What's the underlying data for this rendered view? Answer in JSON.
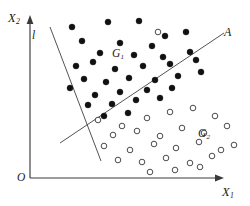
{
  "figure": {
    "background_color": "#ffffff",
    "axis_color": "#3a3a3a",
    "line_color": "#4a4a4a",
    "filled_point_color": "#111111",
    "open_point_color": "#ffffff"
  },
  "labels": {
    "y_axis": "X",
    "y_axis_sub": "2",
    "x_axis": "X",
    "x_axis_sub": "1",
    "origin": "O",
    "line_l": "l",
    "line_a": "A",
    "group1": "G",
    "group1_sub": "1",
    "group2": "G",
    "group2_sub": "2"
  },
  "chart_data": {
    "type": "scatter",
    "title": "",
    "xlabel": "X1",
    "ylabel": "X2",
    "grid": false,
    "legend": "none",
    "xlim": [
      0,
      250
    ],
    "ylim": [
      0,
      206
    ],
    "note": "Pixel coordinates in image space; y grows downward.",
    "series": [
      {
        "name": "G1",
        "marker": "filled-circle",
        "radius": 3.0,
        "color": "#111111",
        "points": [
          [
            72,
            27
          ],
          [
            108,
            22
          ],
          [
            139,
            21
          ],
          [
            165,
            36
          ],
          [
            82,
            41
          ],
          [
            120,
            43
          ],
          [
            152,
            46
          ],
          [
            186,
            32
          ],
          [
            100,
            53
          ],
          [
            134,
            55
          ],
          [
            163,
            57
          ],
          [
            190,
            52
          ],
          [
            76,
            66
          ],
          [
            93,
            62
          ],
          [
            115,
            69
          ],
          [
            143,
            66
          ],
          [
            170,
            64
          ],
          [
            196,
            60
          ],
          [
            84,
            79
          ],
          [
            106,
            82
          ],
          [
            129,
            78
          ],
          [
            155,
            80
          ],
          [
            178,
            76
          ],
          [
            201,
            72
          ],
          [
            70,
            88
          ],
          [
            95,
            95
          ],
          [
            120,
            92
          ],
          [
            147,
            90
          ],
          [
            172,
            88
          ],
          [
            88,
            105
          ],
          [
            112,
            104
          ],
          [
            136,
            100
          ],
          [
            160,
            98
          ],
          [
            104,
            116
          ],
          [
            128,
            113
          ]
        ]
      },
      {
        "name": "G2",
        "marker": "open-circle",
        "radius": 2.8,
        "color": "#2a2a2a",
        "points": [
          [
            158,
            32
          ],
          [
            98,
            120
          ],
          [
            122,
            126
          ],
          [
            147,
            118
          ],
          [
            170,
            112
          ],
          [
            193,
            108
          ],
          [
            215,
            116
          ],
          [
            113,
            135
          ],
          [
            137,
            131
          ],
          [
            160,
            136
          ],
          [
            182,
            128
          ],
          [
            204,
            133
          ],
          [
            227,
            126
          ],
          [
            104,
            146
          ],
          [
            130,
            150
          ],
          [
            154,
            144
          ],
          [
            176,
            148
          ],
          [
            199,
            142
          ],
          [
            221,
            150
          ],
          [
            118,
            160
          ],
          [
            142,
            162
          ],
          [
            166,
            158
          ],
          [
            190,
            163
          ],
          [
            212,
            156
          ],
          [
            234,
            145
          ],
          [
            150,
            172
          ],
          [
            175,
            170
          ],
          [
            200,
            167
          ]
        ]
      }
    ],
    "lines": [
      {
        "name": "A",
        "role": "discriminant-boundary",
        "from": [
          60,
          143
        ],
        "to": [
          224,
          33
        ]
      },
      {
        "name": "l",
        "role": "projection-axis",
        "from": [
          50,
          27
        ],
        "to": [
          101,
          161
        ]
      }
    ],
    "axes": [
      {
        "name": "y-axis",
        "from": [
          30,
          178
        ],
        "to": [
          30,
          18
        ],
        "arrow": true
      },
      {
        "name": "x-axis",
        "from": [
          30,
          178
        ],
        "to": [
          222,
          178
        ],
        "arrow": true
      }
    ]
  }
}
